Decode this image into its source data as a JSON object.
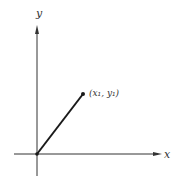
{
  "diagram": {
    "axes": {
      "x_label": "x",
      "y_label": "y"
    },
    "point": {
      "label": "(x₁, y₁)"
    },
    "colors": {
      "axis": "#333333",
      "vector": "#1a1a1a",
      "background": "#ffffff"
    }
  }
}
